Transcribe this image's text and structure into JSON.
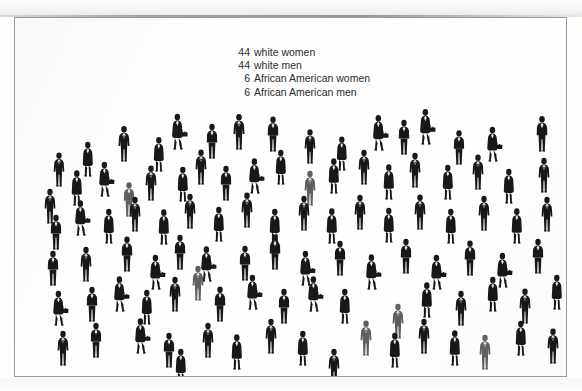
{
  "figure": {
    "kind": "scanned-pictogram-infographic",
    "background_color": "#fefefe",
    "border_color": "#9a9a9f",
    "page_background": "#ffffff"
  },
  "caption": {
    "lines": [
      {
        "count": "44",
        "label": "white women"
      },
      {
        "count": "44",
        "label": "white men"
      },
      {
        "count": "6",
        "label": "African American women"
      },
      {
        "count": "6",
        "label": "African American men"
      }
    ],
    "text_color": "#2b2b2d"
  },
  "chart_data": {
    "type": "pictogram",
    "title": "",
    "subtitle": "",
    "xlabel": "",
    "ylabel": "",
    "unit": "1 icon = 1 person",
    "total": 100,
    "categories": [
      "white women",
      "white men",
      "African American women",
      "African American men"
    ],
    "values": [
      44,
      44,
      6,
      6
    ],
    "percentages": [
      44,
      44,
      6,
      6
    ],
    "series": [
      {
        "name": "white women",
        "value": 44,
        "icon": "woman-with-briefcase",
        "color": "#1b1b1b"
      },
      {
        "name": "white men",
        "value": 44,
        "icon": "man-standing",
        "color": "#1b1b1b"
      },
      {
        "name": "African American women",
        "value": 6,
        "icon": "woman-with-briefcase",
        "color": "#5e5e5e"
      },
      {
        "name": "African American men",
        "value": 6,
        "icon": "man-standing",
        "color": "#5e5e5e"
      }
    ],
    "legend_position": "top-center",
    "grid": false
  },
  "crowd": {
    "icon_dark": "#181818",
    "icon_grey": "#5f5f61",
    "people": [
      {
        "x": 36,
        "y": 133,
        "s": 0.98,
        "t": "m",
        "g": "d"
      },
      {
        "x": 65,
        "y": 123,
        "s": 1.0,
        "t": "w",
        "g": "d"
      },
      {
        "x": 101,
        "y": 108,
        "s": 1.02,
        "t": "m",
        "g": "d"
      },
      {
        "x": 136,
        "y": 118,
        "s": 0.99,
        "t": "w",
        "g": "d"
      },
      {
        "x": 155,
        "y": 96,
        "s": 1.03,
        "t": "w",
        "g": "d"
      },
      {
        "x": 189,
        "y": 105,
        "s": 1.0,
        "t": "m",
        "g": "d"
      },
      {
        "x": 216,
        "y": 96,
        "s": 1.02,
        "t": "m",
        "g": "d"
      },
      {
        "x": 250,
        "y": 98,
        "s": 1.01,
        "t": "m",
        "g": "d"
      },
      {
        "x": 287,
        "y": 110,
        "s": 0.99,
        "t": "m",
        "g": "d"
      },
      {
        "x": 319,
        "y": 117,
        "s": 0.98,
        "t": "w",
        "g": "d"
      },
      {
        "x": 356,
        "y": 97,
        "s": 1.02,
        "t": "w",
        "g": "d"
      },
      {
        "x": 381,
        "y": 101,
        "s": 1.0,
        "t": "m",
        "g": "d"
      },
      {
        "x": 403,
        "y": 91,
        "s": 1.02,
        "t": "w",
        "g": "d"
      },
      {
        "x": 436,
        "y": 111,
        "s": 0.99,
        "t": "m",
        "g": "d"
      },
      {
        "x": 470,
        "y": 108,
        "s": 1.0,
        "t": "w",
        "g": "d"
      },
      {
        "x": 519,
        "y": 98,
        "s": 1.02,
        "t": "m",
        "g": "d"
      },
      {
        "x": 27,
        "y": 170,
        "s": 1.0,
        "t": "m",
        "g": "d"
      },
      {
        "x": 54,
        "y": 152,
        "s": 1.01,
        "t": "w",
        "g": "d"
      },
      {
        "x": 82,
        "y": 143,
        "s": 1.0,
        "t": "w",
        "g": "d"
      },
      {
        "x": 106,
        "y": 163,
        "s": 0.99,
        "t": "m",
        "g": "g"
      },
      {
        "x": 128,
        "y": 147,
        "s": 1.01,
        "t": "m",
        "g": "d"
      },
      {
        "x": 160,
        "y": 148,
        "s": 1.0,
        "t": "w",
        "g": "d"
      },
      {
        "x": 178,
        "y": 131,
        "s": 1.01,
        "t": "m",
        "g": "d"
      },
      {
        "x": 203,
        "y": 147,
        "s": 1.0,
        "t": "m",
        "g": "d"
      },
      {
        "x": 232,
        "y": 140,
        "s": 1.01,
        "t": "w",
        "g": "d"
      },
      {
        "x": 258,
        "y": 131,
        "s": 1.0,
        "t": "w",
        "g": "d"
      },
      {
        "x": 287,
        "y": 152,
        "s": 1.0,
        "t": "m",
        "g": "g"
      },
      {
        "x": 311,
        "y": 140,
        "s": 1.01,
        "t": "w",
        "g": "d"
      },
      {
        "x": 341,
        "y": 131,
        "s": 1.0,
        "t": "m",
        "g": "d"
      },
      {
        "x": 366,
        "y": 146,
        "s": 1.01,
        "t": "w",
        "g": "d"
      },
      {
        "x": 392,
        "y": 134,
        "s": 1.0,
        "t": "m",
        "g": "d"
      },
      {
        "x": 425,
        "y": 146,
        "s": 1.0,
        "t": "w",
        "g": "d"
      },
      {
        "x": 455,
        "y": 136,
        "s": 1.01,
        "t": "m",
        "g": "d"
      },
      {
        "x": 486,
        "y": 150,
        "s": 1.0,
        "t": "w",
        "g": "d"
      },
      {
        "x": 521,
        "y": 139,
        "s": 1.0,
        "t": "m",
        "g": "d"
      },
      {
        "x": 33,
        "y": 196,
        "s": 1.0,
        "t": "m",
        "g": "d"
      },
      {
        "x": 58,
        "y": 182,
        "s": 1.01,
        "t": "w",
        "g": "d"
      },
      {
        "x": 86,
        "y": 190,
        "s": 1.0,
        "t": "w",
        "g": "d"
      },
      {
        "x": 112,
        "y": 178,
        "s": 1.0,
        "t": "m",
        "g": "d"
      },
      {
        "x": 141,
        "y": 191,
        "s": 1.01,
        "t": "w",
        "g": "d"
      },
      {
        "x": 167,
        "y": 175,
        "s": 1.0,
        "t": "m",
        "g": "d"
      },
      {
        "x": 196,
        "y": 188,
        "s": 1.0,
        "t": "w",
        "g": "d"
      },
      {
        "x": 224,
        "y": 174,
        "s": 1.01,
        "t": "m",
        "g": "d"
      },
      {
        "x": 252,
        "y": 190,
        "s": 1.0,
        "t": "w",
        "g": "d"
      },
      {
        "x": 281,
        "y": 177,
        "s": 1.0,
        "t": "m",
        "g": "d"
      },
      {
        "x": 309,
        "y": 190,
        "s": 1.01,
        "t": "w",
        "g": "d"
      },
      {
        "x": 337,
        "y": 176,
        "s": 1.0,
        "t": "m",
        "g": "d"
      },
      {
        "x": 366,
        "y": 189,
        "s": 1.0,
        "t": "w",
        "g": "d"
      },
      {
        "x": 397,
        "y": 176,
        "s": 1.01,
        "t": "m",
        "g": "d"
      },
      {
        "x": 428,
        "y": 190,
        "s": 1.0,
        "t": "w",
        "g": "d"
      },
      {
        "x": 461,
        "y": 177,
        "s": 1.0,
        "t": "m",
        "g": "d"
      },
      {
        "x": 494,
        "y": 190,
        "s": 1.01,
        "t": "w",
        "g": "d"
      },
      {
        "x": 524,
        "y": 178,
        "s": 1.0,
        "t": "m",
        "g": "d"
      },
      {
        "x": 30,
        "y": 232,
        "s": 1.0,
        "t": "m",
        "g": "d"
      },
      {
        "x": 63,
        "y": 228,
        "s": 1.0,
        "t": "m",
        "g": "d"
      },
      {
        "x": 104,
        "y": 218,
        "s": 1.01,
        "t": "m",
        "g": "d"
      },
      {
        "x": 133,
        "y": 236,
        "s": 1.0,
        "t": "w",
        "g": "d"
      },
      {
        "x": 157,
        "y": 216,
        "s": 1.0,
        "t": "m",
        "g": "d"
      },
      {
        "x": 184,
        "y": 228,
        "s": 1.01,
        "t": "w",
        "g": "d"
      },
      {
        "x": 222,
        "y": 227,
        "s": 1.0,
        "t": "m",
        "g": "d"
      },
      {
        "x": 175,
        "y": 247,
        "s": 1.0,
        "t": "m",
        "g": "g"
      },
      {
        "x": 252,
        "y": 216,
        "s": 1.01,
        "t": "m",
        "g": "d"
      },
      {
        "x": 283,
        "y": 232,
        "s": 1.0,
        "t": "w",
        "g": "d"
      },
      {
        "x": 317,
        "y": 222,
        "s": 1.0,
        "t": "m",
        "g": "d"
      },
      {
        "x": 349,
        "y": 236,
        "s": 1.01,
        "t": "w",
        "g": "d"
      },
      {
        "x": 383,
        "y": 220,
        "s": 1.0,
        "t": "m",
        "g": "d"
      },
      {
        "x": 414,
        "y": 236,
        "s": 1.0,
        "t": "w",
        "g": "d"
      },
      {
        "x": 447,
        "y": 222,
        "s": 1.01,
        "t": "m",
        "g": "d"
      },
      {
        "x": 480,
        "y": 234,
        "s": 1.0,
        "t": "w",
        "g": "d"
      },
      {
        "x": 515,
        "y": 220,
        "s": 1.0,
        "t": "m",
        "g": "d"
      },
      {
        "x": 36,
        "y": 272,
        "s": 1.0,
        "t": "w",
        "g": "d"
      },
      {
        "x": 69,
        "y": 268,
        "s": 1.0,
        "t": "m",
        "g": "d"
      },
      {
        "x": 97,
        "y": 258,
        "s": 1.01,
        "t": "w",
        "g": "d"
      },
      {
        "x": 124,
        "y": 271,
        "s": 1.0,
        "t": "w",
        "g": "d"
      },
      {
        "x": 152,
        "y": 258,
        "s": 1.0,
        "t": "m",
        "g": "d"
      },
      {
        "x": 197,
        "y": 268,
        "s": 1.01,
        "t": "m",
        "g": "d"
      },
      {
        "x": 230,
        "y": 256,
        "s": 1.0,
        "t": "w",
        "g": "d"
      },
      {
        "x": 261,
        "y": 270,
        "s": 1.0,
        "t": "m",
        "g": "d"
      },
      {
        "x": 291,
        "y": 258,
        "s": 1.01,
        "t": "w",
        "g": "d"
      },
      {
        "x": 322,
        "y": 270,
        "s": 1.0,
        "t": "w",
        "g": "d"
      },
      {
        "x": 375,
        "y": 285,
        "s": 1.0,
        "t": "m",
        "g": "g"
      },
      {
        "x": 404,
        "y": 264,
        "s": 1.01,
        "t": "w",
        "g": "d"
      },
      {
        "x": 438,
        "y": 272,
        "s": 1.0,
        "t": "m",
        "g": "d"
      },
      {
        "x": 470,
        "y": 258,
        "s": 1.0,
        "t": "w",
        "g": "d"
      },
      {
        "x": 502,
        "y": 270,
        "s": 1.01,
        "t": "m",
        "g": "d"
      },
      {
        "x": 534,
        "y": 256,
        "s": 1.0,
        "t": "w",
        "g": "d"
      },
      {
        "x": 40,
        "y": 312,
        "s": 1.0,
        "t": "m",
        "g": "d"
      },
      {
        "x": 73,
        "y": 304,
        "s": 1.0,
        "t": "m",
        "g": "d"
      },
      {
        "x": 118,
        "y": 300,
        "s": 1.01,
        "t": "w",
        "g": "d"
      },
      {
        "x": 146,
        "y": 314,
        "s": 1.0,
        "t": "m",
        "g": "d"
      },
      {
        "x": 185,
        "y": 304,
        "s": 1.0,
        "t": "m",
        "g": "d"
      },
      {
        "x": 214,
        "y": 316,
        "s": 1.01,
        "t": "w",
        "g": "d"
      },
      {
        "x": 248,
        "y": 300,
        "s": 1.0,
        "t": "m",
        "g": "d"
      },
      {
        "x": 280,
        "y": 312,
        "s": 1.0,
        "t": "w",
        "g": "d"
      },
      {
        "x": 343,
        "y": 302,
        "s": 1.01,
        "t": "m",
        "g": "g"
      },
      {
        "x": 372,
        "y": 314,
        "s": 1.0,
        "t": "w",
        "g": "d"
      },
      {
        "x": 401,
        "y": 300,
        "s": 1.0,
        "t": "m",
        "g": "d"
      },
      {
        "x": 432,
        "y": 312,
        "s": 1.01,
        "t": "w",
        "g": "d"
      },
      {
        "x": 462,
        "y": 316,
        "s": 1.0,
        "t": "m",
        "g": "g"
      },
      {
        "x": 498,
        "y": 302,
        "s": 1.0,
        "t": "w",
        "g": "d"
      },
      {
        "x": 530,
        "y": 310,
        "s": 1.01,
        "t": "m",
        "g": "d"
      },
      {
        "x": 158,
        "y": 330,
        "s": 1.0,
        "t": "w",
        "g": "d"
      },
      {
        "x": 311,
        "y": 330,
        "s": 1.0,
        "t": "m",
        "g": "d"
      }
    ]
  }
}
